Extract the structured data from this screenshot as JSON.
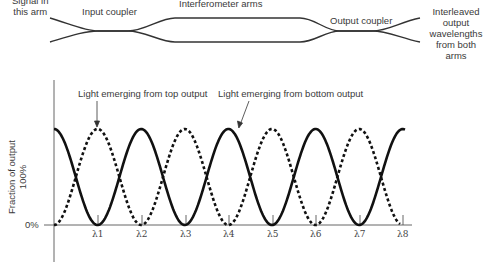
{
  "diagram": {
    "input_label": "Signal in this arm",
    "input_label_lines": [
      "Signal in",
      "this arm"
    ],
    "input_coupler": "Input coupler",
    "arms": "Interferometer arms",
    "output_coupler": "Output coupler",
    "output_label_lines": [
      "Interleaved",
      "output",
      "wavelengths",
      "from both",
      "arms"
    ]
  },
  "chart_data": {
    "type": "line",
    "title": "",
    "ylabel": "Fraction of output",
    "ytick_labels": [
      "0%",
      "100%"
    ],
    "ylim": [
      0,
      100
    ],
    "x_tick_labels": [
      "λ1",
      "λ2",
      "λ3",
      "λ4",
      "λ5",
      "λ6",
      "λ7",
      "λ8"
    ],
    "grid": false,
    "annotations": [
      "Light emerging from top output",
      "Light emerging from bottom output"
    ],
    "series": [
      {
        "name": "Light emerging from bottom output",
        "style": "solid",
        "description": "Periodic (cos^2) transmission; 100% at start, minima (0%) at λ1, λ3, λ5, λ7",
        "x": [
          "start",
          "λ1",
          "λ2",
          "λ3",
          "λ4",
          "λ5",
          "λ6",
          "λ7",
          "λ8"
        ],
        "values": [
          100,
          0,
          100,
          0,
          100,
          0,
          100,
          0,
          100
        ]
      },
      {
        "name": "Light emerging from top output",
        "style": "dashed",
        "description": "Complementary (sin^2) transmission; 0% at start, minima (0%) at λ2, λ4, λ6, λ8",
        "x": [
          "start",
          "λ1",
          "λ2",
          "λ3",
          "λ4",
          "λ5",
          "λ6",
          "λ7",
          "λ8"
        ],
        "values": [
          0,
          100,
          0,
          100,
          0,
          100,
          0,
          100,
          0
        ]
      }
    ]
  }
}
